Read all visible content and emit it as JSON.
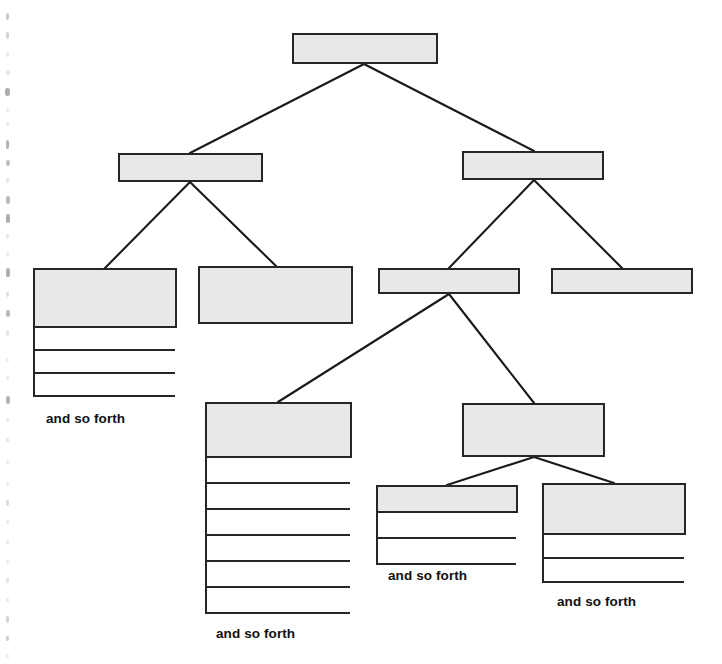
{
  "diagram": {
    "palette": {
      "box_fill": "#e8e8e8",
      "box_stroke": "#262626",
      "edge_stroke": "#1a1a1a",
      "page_background": "#ffffff",
      "caption_color": "#101010"
    },
    "caption_text": "and so forth",
    "nodes": [
      {
        "id": "root",
        "label": "",
        "level": 1,
        "x": 292,
        "y": 33,
        "w": 146,
        "h": 31,
        "rows": 0
      },
      {
        "id": "l2-left",
        "label": "",
        "level": 2,
        "x": 118,
        "y": 153,
        "w": 145,
        "h": 29,
        "rows": 0
      },
      {
        "id": "l2-right",
        "label": "",
        "level": 2,
        "x": 462,
        "y": 151,
        "w": 142,
        "h": 29,
        "rows": 0
      },
      {
        "id": "l3-a",
        "label": "",
        "level": 3,
        "x": 33,
        "y": 268,
        "w": 144,
        "h": 60,
        "rows": 3,
        "row_height": 23,
        "caption": "and so forth",
        "caption_x": 46,
        "caption_y": 411
      },
      {
        "id": "l3-b",
        "label": "",
        "level": 3,
        "x": 198,
        "y": 266,
        "w": 155,
        "h": 58,
        "rows": 0
      },
      {
        "id": "l3-c",
        "label": "",
        "level": 3,
        "x": 378,
        "y": 268,
        "w": 142,
        "h": 26,
        "rows": 0
      },
      {
        "id": "l3-d",
        "label": "",
        "level": 3,
        "x": 551,
        "y": 268,
        "w": 142,
        "h": 26,
        "rows": 0
      },
      {
        "id": "l4-center",
        "label": "",
        "level": 4,
        "x": 205,
        "y": 402,
        "w": 147,
        "h": 56,
        "rows": 6,
        "row_height": 26,
        "caption": "and so forth",
        "caption_x": 216,
        "caption_y": 626
      },
      {
        "id": "l4-right",
        "label": "",
        "level": 4,
        "x": 462,
        "y": 403,
        "w": 143,
        "h": 54,
        "rows": 0
      },
      {
        "id": "l5-a",
        "label": "",
        "level": 5,
        "x": 376,
        "y": 485,
        "w": 142,
        "h": 28,
        "rows": 2,
        "row_height": 26,
        "caption": "and so forth",
        "caption_x": 388,
        "caption_y": 568
      },
      {
        "id": "l5-b",
        "label": "",
        "level": 5,
        "x": 542,
        "y": 483,
        "w": 144,
        "h": 52,
        "rows": 2,
        "row_height": 24,
        "caption": "and so forth",
        "caption_x": 557,
        "caption_y": 594
      }
    ],
    "edges": [
      {
        "from": "root",
        "to": "l2-left",
        "x1": 364,
        "y1": 64,
        "x2": 190,
        "y2": 153
      },
      {
        "from": "root",
        "to": "l2-right",
        "x1": 364,
        "y1": 64,
        "x2": 534,
        "y2": 151
      },
      {
        "from": "l2-left",
        "to": "l3-a",
        "x1": 190,
        "y1": 182,
        "x2": 105,
        "y2": 268
      },
      {
        "from": "l2-left",
        "to": "l3-b",
        "x1": 190,
        "y1": 182,
        "x2": 276,
        "y2": 266
      },
      {
        "from": "l2-right",
        "to": "l3-c",
        "x1": 534,
        "y1": 180,
        "x2": 449,
        "y2": 268
      },
      {
        "from": "l2-right",
        "to": "l3-d",
        "x1": 534,
        "y1": 180,
        "x2": 622,
        "y2": 268
      },
      {
        "from": "l3-c",
        "to": "l4-center",
        "x1": 449,
        "y1": 294,
        "x2": 278,
        "y2": 402
      },
      {
        "from": "l3-c",
        "to": "l4-right",
        "x1": 449,
        "y1": 294,
        "x2": 534,
        "y2": 403
      },
      {
        "from": "l4-right",
        "to": "l5-a",
        "x1": 534,
        "y1": 457,
        "x2": 447,
        "y2": 485
      },
      {
        "from": "l4-right",
        "to": "l5-b",
        "x1": 534,
        "y1": 457,
        "x2": 614,
        "y2": 483
      }
    ],
    "scan_artifacts": [
      {
        "x": 6,
        "y": 13,
        "w": 3,
        "h": 7,
        "o": 0.55
      },
      {
        "x": 6,
        "y": 32,
        "w": 3,
        "h": 7,
        "o": 0.45
      },
      {
        "x": 6,
        "y": 52,
        "w": 3,
        "h": 5,
        "o": 0.22
      },
      {
        "x": 6,
        "y": 70,
        "w": 4,
        "h": 5,
        "o": 0.25
      },
      {
        "x": 5,
        "y": 88,
        "w": 5,
        "h": 8,
        "o": 0.8
      },
      {
        "x": 6,
        "y": 108,
        "w": 3,
        "h": 4,
        "o": 0.18
      },
      {
        "x": 6,
        "y": 122,
        "w": 3,
        "h": 4,
        "o": 0.2
      },
      {
        "x": 6,
        "y": 140,
        "w": 3,
        "h": 9,
        "o": 0.75
      },
      {
        "x": 6,
        "y": 160,
        "w": 4,
        "h": 6,
        "o": 0.6
      },
      {
        "x": 6,
        "y": 178,
        "w": 3,
        "h": 5,
        "o": 0.25
      },
      {
        "x": 6,
        "y": 196,
        "w": 4,
        "h": 8,
        "o": 0.65
      },
      {
        "x": 6,
        "y": 214,
        "w": 4,
        "h": 9,
        "o": 0.8
      },
      {
        "x": 6,
        "y": 234,
        "w": 3,
        "h": 5,
        "o": 0.22
      },
      {
        "x": 6,
        "y": 252,
        "w": 3,
        "h": 5,
        "o": 0.2
      },
      {
        "x": 6,
        "y": 268,
        "w": 4,
        "h": 9,
        "o": 0.8
      },
      {
        "x": 6,
        "y": 292,
        "w": 3,
        "h": 5,
        "o": 0.3
      },
      {
        "x": 6,
        "y": 310,
        "w": 4,
        "h": 7,
        "o": 0.7
      },
      {
        "x": 6,
        "y": 330,
        "w": 3,
        "h": 6,
        "o": 0.25
      },
      {
        "x": 6,
        "y": 358,
        "w": 3,
        "h": 4,
        "o": 0.18
      },
      {
        "x": 6,
        "y": 376,
        "w": 3,
        "h": 4,
        "o": 0.2
      },
      {
        "x": 6,
        "y": 396,
        "w": 4,
        "h": 8,
        "o": 0.75
      },
      {
        "x": 6,
        "y": 418,
        "w": 3,
        "h": 4,
        "o": 0.2
      },
      {
        "x": 6,
        "y": 438,
        "w": 3,
        "h": 4,
        "o": 0.25
      },
      {
        "x": 6,
        "y": 460,
        "w": 3,
        "h": 4,
        "o": 0.18
      },
      {
        "x": 6,
        "y": 482,
        "w": 3,
        "h": 4,
        "o": 0.18
      },
      {
        "x": 6,
        "y": 500,
        "w": 3,
        "h": 6,
        "o": 0.35
      },
      {
        "x": 6,
        "y": 520,
        "w": 3,
        "h": 4,
        "o": 0.2
      },
      {
        "x": 6,
        "y": 540,
        "w": 3,
        "h": 4,
        "o": 0.22
      },
      {
        "x": 6,
        "y": 560,
        "w": 3,
        "h": 4,
        "o": 0.18
      },
      {
        "x": 6,
        "y": 578,
        "w": 3,
        "h": 5,
        "o": 0.28
      },
      {
        "x": 6,
        "y": 598,
        "w": 3,
        "h": 4,
        "o": 0.22
      },
      {
        "x": 6,
        "y": 616,
        "w": 3,
        "h": 7,
        "o": 0.45
      },
      {
        "x": 6,
        "y": 636,
        "w": 3,
        "h": 5,
        "o": 0.5
      },
      {
        "x": 6,
        "y": 654,
        "w": 3,
        "h": 4,
        "o": 0.2
      }
    ]
  }
}
